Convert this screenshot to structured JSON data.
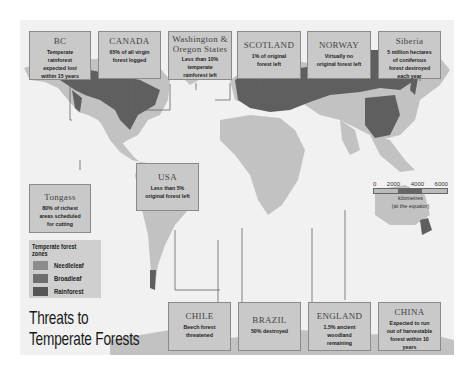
{
  "title": {
    "line1": "Threats to",
    "line2": "Temperate Forests"
  },
  "legend": {
    "title": "Temperate forest zones",
    "items": [
      {
        "label": "Needleleaf",
        "color": "#8c8c8c"
      },
      {
        "label": "Broadleaf",
        "color": "#6e6e6e"
      },
      {
        "label": "Rainforest",
        "color": "#555555"
      }
    ]
  },
  "scale": {
    "ticks": [
      "0",
      "2000",
      "4000",
      "6000"
    ],
    "unit": "kilometres",
    "note": "(at the equator)"
  },
  "callouts": {
    "bc": {
      "title": "BC",
      "text": "Temperate rainforest expected lost within 15 years"
    },
    "canada": {
      "title": "CANADA",
      "text": "65% of all virgin forest logged"
    },
    "washington": {
      "title": "Washington & Oregon States",
      "text": "Less than 10% temperate rainforest left"
    },
    "scotland": {
      "title": "SCOTLAND",
      "text": "1% of original forest left"
    },
    "norway": {
      "title": "NORWAY",
      "text": "Virtually no original forest left"
    },
    "siberia": {
      "title": "Siberia",
      "text": "5 million hectares of coniferous forest destroyed each year"
    },
    "usa": {
      "title": "USA",
      "text": "Less than 5% original forest left"
    },
    "tongass": {
      "title": "Tongass",
      "text": "80% of richest areas scheduled for cutting"
    },
    "chile": {
      "title": "CHILE",
      "text": "Beech forest threatened"
    },
    "brazil": {
      "title": "BRAZIL",
      "text": "50% destroyed"
    },
    "england": {
      "title": "ENGLAND",
      "text": "1.5% ancient woodland remaining"
    },
    "china": {
      "title": "CHINA",
      "text": "Expected to run out of harvestable forest within 10 years"
    }
  },
  "colors": {
    "land": "#c2c2c2",
    "forest": "#5f5f5f",
    "ocean": "#f1f1f1",
    "box": "#c9c9c9"
  }
}
